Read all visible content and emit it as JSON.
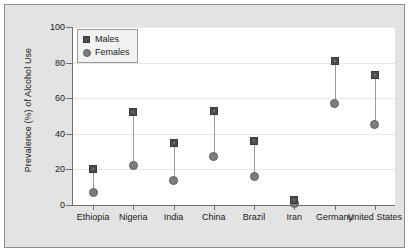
{
  "chart_data": {
    "type": "scatter",
    "subtype": "dumbbell",
    "title": "",
    "xlabel": "",
    "ylabel": "Prevalence (%) of Alcohol Use",
    "ylim": [
      0,
      100
    ],
    "yticks": [
      0,
      20,
      40,
      60,
      80,
      100
    ],
    "ytick_labels": [
      "0",
      "20",
      "40",
      "60",
      "80",
      "100"
    ],
    "grid": true,
    "grid_axis": "y",
    "legend_position": "top-left",
    "categories": [
      "Ethiopia",
      "Nigeria",
      "India",
      "China",
      "Brazil",
      "Iran",
      "Germany",
      "United States"
    ],
    "series": [
      {
        "name": "Males",
        "marker": "square",
        "color": "#4d4d4d",
        "values": [
          20,
          52,
          35,
          53,
          36,
          3,
          81,
          73
        ]
      },
      {
        "name": "Females",
        "marker": "circle",
        "color": "#7d7d7d",
        "values": [
          7,
          22,
          14,
          27,
          16,
          1,
          57,
          45
        ]
      }
    ]
  },
  "legend": {
    "items": [
      {
        "label": "Males",
        "marker": "square"
      },
      {
        "label": "Females",
        "marker": "circle"
      }
    ]
  }
}
